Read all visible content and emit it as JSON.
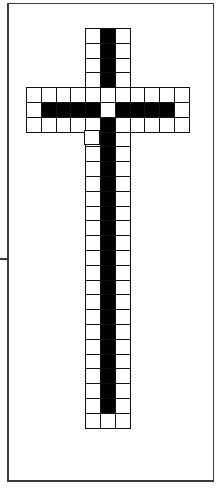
{
  "figure": {
    "title": "",
    "colors": {
      "filled": "#000000",
      "empty": "#ffffff",
      "line": "#111111",
      "frame": "#3a3a3a"
    },
    "cell_size": 14.8,
    "origin": {
      "x": 26,
      "y": 28
    },
    "columns": 11,
    "cross": {
      "vertical_column_cols": [
        4,
        5,
        6
      ],
      "top_rows": 4,
      "arm_rows": 3,
      "bottom_rows": 20
    },
    "rows": [
      "....oxo....",
      "....oxo....",
      "....oxo....",
      "....oxo....",
      "ooooooooooo",
      "oxxxxoxxxxo",
      "oooooxooooo",
      "....oxo....",
      "....oxo....",
      "....oxo....",
      "....oxo....",
      "....oxo....",
      "....oxo....",
      "....oxo....",
      "....oxo....",
      "....oxo....",
      "....oxo....",
      "....oxo....",
      "....oxo....",
      "....oxo....",
      "....oxo....",
      "....oxo....",
      "....oxo....",
      "....oxo....",
      "....oxo....",
      "....oxo....",
      "....ooo...."
    ],
    "legend": {
      "x": "filled",
      "o": "empty",
      ".": "none"
    }
  }
}
